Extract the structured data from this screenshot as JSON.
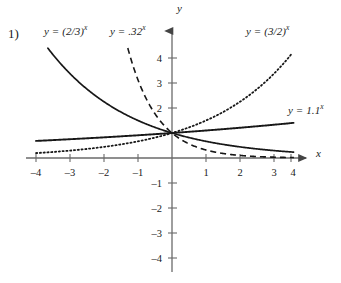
{
  "problem": {
    "number": "1)"
  },
  "axes": {
    "x_axis_label": "x",
    "y_axis_label": "y",
    "x_ticks": [
      {
        "value": -4,
        "label": "–4"
      },
      {
        "value": -3,
        "label": "–3"
      },
      {
        "value": -2,
        "label": "–2"
      },
      {
        "value": -1,
        "label": "–1"
      },
      {
        "value": 1,
        "label": "1"
      },
      {
        "value": 2,
        "label": "2"
      },
      {
        "value": 3,
        "label": "3"
      },
      {
        "value": 4,
        "label": "4"
      }
    ],
    "y_ticks": [
      {
        "value": 4,
        "label": "4"
      },
      {
        "value": 3,
        "label": "3"
      },
      {
        "value": 2,
        "label": "2"
      },
      {
        "value": -1,
        "label": "–1"
      },
      {
        "value": -2,
        "label": "–2"
      },
      {
        "value": -3,
        "label": "–3"
      },
      {
        "value": -4,
        "label": "–4"
      }
    ],
    "xlim": [
      -4.6,
      4.6
    ],
    "ylim": [
      -4.4,
      4.7
    ],
    "grid": false,
    "axis_color": "#6a6a6a"
  },
  "curve_labels": {
    "two_thirds": {
      "lead": "y = (2/3)",
      "exp": "x"
    },
    "point32": {
      "lead": "y = .32",
      "exp": "x"
    },
    "three_halves": {
      "lead": "y = (3/2)",
      "exp": "x"
    },
    "one_point_one": {
      "lead": "y = 1.1",
      "exp": "x"
    }
  },
  "chart_data": {
    "type": "line",
    "title": "",
    "xlabel": "x",
    "ylabel": "y",
    "xlim": [
      -4.6,
      4.6
    ],
    "ylim": [
      -4.4,
      4.7
    ],
    "grid": false,
    "legend_position": "inline-annotations",
    "x_ticks": [
      -4,
      -3,
      -2,
      -1,
      1,
      2,
      3,
      4
    ],
    "y_ticks": [
      4,
      3,
      2,
      -1,
      -2,
      -3,
      -4
    ],
    "series": [
      {
        "name": "y = (2/3)^x",
        "base": 0.6667,
        "style": "solid",
        "color": "#1a1a1a",
        "x": [
          -4,
          -3.5,
          -3,
          -2.5,
          -2,
          -1.5,
          -1,
          -0.5,
          0,
          0.5,
          1,
          1.5,
          2,
          2.5,
          3,
          3.5,
          4
        ],
        "y": [
          5.06,
          4.13,
          3.38,
          2.76,
          2.25,
          1.84,
          1.5,
          1.22,
          1,
          0.82,
          0.67,
          0.54,
          0.44,
          0.36,
          0.3,
          0.24,
          0.2
        ]
      },
      {
        "name": "y = .32^x",
        "base": 0.32,
        "style": "dashed",
        "color": "#1a1a1a",
        "x": [
          -1.3,
          -1.2,
          -1.1,
          -1,
          -0.75,
          -0.5,
          -0.25,
          0,
          0.5,
          1,
          1.5,
          2,
          2.5,
          3,
          3.5,
          4
        ],
        "y": [
          4.6,
          4.02,
          3.52,
          3.13,
          2.2,
          1.77,
          1.33,
          1,
          0.57,
          0.32,
          0.18,
          0.102,
          0.058,
          0.033,
          0.019,
          0.01
        ]
      },
      {
        "name": "y = (3/2)^x",
        "base": 1.5,
        "style": "dotted",
        "color": "#1a1a1a",
        "x": [
          -4,
          -3.5,
          -3,
          -2.5,
          -2,
          -1.5,
          -1,
          -0.5,
          0,
          0.5,
          1,
          1.5,
          2,
          2.5,
          3,
          3.5
        ],
        "y": [
          0.198,
          0.242,
          0.296,
          0.363,
          0.444,
          0.544,
          0.667,
          0.816,
          1,
          1.225,
          1.5,
          1.837,
          2.25,
          2.756,
          3.375,
          4.13
        ]
      },
      {
        "name": "y = 1.1^x",
        "base": 1.1,
        "style": "solid",
        "color": "#1a1a1a",
        "x": [
          -4,
          -3,
          -2,
          -1,
          0,
          1,
          2,
          3,
          4
        ],
        "y": [
          0.683,
          0.751,
          0.826,
          0.909,
          1,
          1.1,
          1.21,
          1.331,
          1.464
        ]
      }
    ]
  },
  "geometry": {
    "origin_x": 172,
    "origin_y": 158,
    "unit_x": 34,
    "unit_y": 25
  }
}
